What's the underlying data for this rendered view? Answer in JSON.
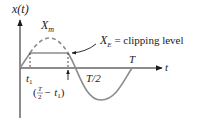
{
  "diagram": {
    "y_axis_label": "x(t)",
    "x_axis_label": "t",
    "labels": {
      "peak": "X",
      "peak_sub": "m",
      "clip": "X",
      "clip_sub": "E",
      "clip_text": " = clipping level",
      "t1": "t",
      "t1_sub": "1",
      "half_period": "T/2",
      "period": "T",
      "end_clip_open": "(",
      "end_clip_num": "T",
      "end_clip_den": "2",
      "end_clip_minus": " − t",
      "end_clip_sub": "1",
      "end_clip_close": ")"
    },
    "colors": {
      "axis": "#1a1a1a",
      "curve": "#8c8c8c",
      "text": "#1a1a1a"
    }
  }
}
